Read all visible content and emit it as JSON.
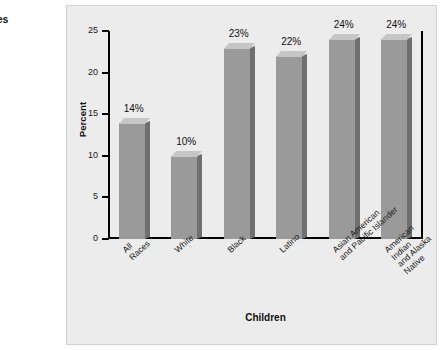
{
  "caption": {
    "title_lines": "n under\nd Families",
    "source_line": ", Table 7."
  },
  "chart_data": {
    "type": "bar",
    "title": "",
    "xlabel": "Children",
    "ylabel": "Percent",
    "categories": [
      "All\nRaces",
      "White",
      "Black",
      "Latino",
      "Asian American\nand Pacific Islander",
      "American Indian\nand Alaska Native"
    ],
    "values": [
      14,
      10,
      23,
      22,
      24,
      24
    ],
    "value_labels": [
      "14%",
      "10%",
      "23%",
      "22%",
      "24%",
      "24%"
    ],
    "ylim": [
      0,
      25
    ],
    "yticks": [
      25,
      20,
      15,
      10,
      5,
      0
    ],
    "ytick_labels": [
      "25",
      "20",
      "15",
      "10",
      "5",
      "0"
    ],
    "grid": false,
    "legend": "none",
    "bar_color": "#9a9a9a",
    "bar_side_color": "#6f6f6f",
    "bar_top_color": "#c6c6c6",
    "panel_background": "#ececec",
    "axis_color": "#000000"
  }
}
